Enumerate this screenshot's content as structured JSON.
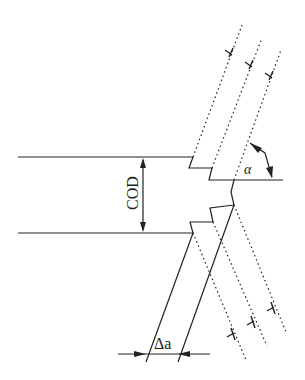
{
  "diagram": {
    "labels": {
      "cod": "COD",
      "delta_a": "Δa",
      "alpha": "α"
    },
    "colors": {
      "line": "#222222",
      "background": "#ffffff"
    }
  }
}
